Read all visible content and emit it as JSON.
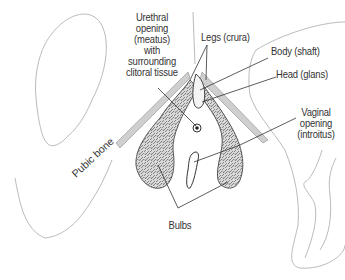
{
  "diagram": {
    "labels": {
      "urethral_opening": [
        "Urethral",
        "opening",
        "(meatus)",
        "with",
        "surrounding",
        "clitoral tissue"
      ],
      "legs": "Legs (crura)",
      "body": "Body (shaft)",
      "head": "Head (glans)",
      "vaginal_opening": [
        "Vaginal",
        "opening",
        "(introitus)"
      ],
      "pubic_bone": "Pubic bone",
      "bulbs": "Bulbs"
    },
    "colors": {
      "outline": "#b8b8b8",
      "structure_outline": "#555555",
      "texture_fill": "#8a8a8a",
      "leader_line": "#333333",
      "label_text": "#333333",
      "bone_band": "#c8c8c8"
    }
  },
  "caption": {
    "text": ""
  }
}
